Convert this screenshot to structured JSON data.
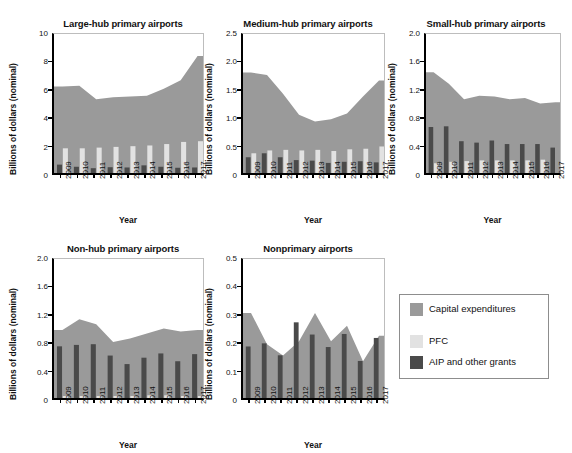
{
  "figure": {
    "yaxis_label": "Billions of dollars (nominal)",
    "xaxis_label": "Year",
    "footnote": ""
  },
  "legend": {
    "items": [
      {
        "label": "Capital expenditures",
        "color": "#9a9a9a",
        "name": "capital-expenditures"
      },
      {
        "label": "PFC",
        "color": "#e2e2e2",
        "name": "pfc"
      },
      {
        "label": "AIP and other grants",
        "color": "#4a4a4a",
        "name": "aip-and-other-grants"
      }
    ]
  },
  "chart_data": [
    {
      "id": "large-hub",
      "type": "area",
      "title": "Large-hub primary airports",
      "xlabel": "Year",
      "ylabel": "Billions of dollars (nominal)",
      "categories": [
        2009,
        2010,
        2011,
        2012,
        2013,
        2014,
        2015,
        2016,
        2017
      ],
      "tick_labels": [
        "2009",
        "2010",
        "2011",
        "2012",
        "2013",
        "2014",
        "2015",
        "2016",
        "2017"
      ],
      "ylim": [
        0,
        10
      ],
      "yticks": [
        0,
        2,
        4,
        6,
        8,
        10
      ],
      "ytick_labels": [
        "0",
        "2",
        "4",
        "6",
        "8",
        "10"
      ],
      "grid": false,
      "series": [
        {
          "name": "Capital expenditures",
          "kind": "area",
          "color": "#9a9a9a",
          "values": [
            6.3,
            6.35,
            5.4,
            5.55,
            5.6,
            5.65,
            6.15,
            6.75,
            8.45
          ]
        },
        {
          "name": "PFC",
          "kind": "bar",
          "color": "#e2e2e2",
          "values": [
            1.95,
            1.95,
            2.0,
            2.05,
            2.1,
            2.15,
            2.25,
            2.4,
            2.45
          ]
        },
        {
          "name": "AIP and other grants",
          "kind": "bar",
          "color": "#4a4a4a",
          "values": [
            0.8,
            0.65,
            0.55,
            0.62,
            0.6,
            0.75,
            0.65,
            0.58,
            0.6
          ]
        }
      ]
    },
    {
      "id": "medium-hub",
      "type": "area",
      "title": "Medium-hub primary airports",
      "xlabel": "Year",
      "ylabel": "Billions of dollars (nominal)",
      "categories": [
        2009,
        2010,
        2011,
        2012,
        2013,
        2014,
        2015,
        2016,
        2017
      ],
      "tick_labels": [
        "2009",
        "2010",
        "2011",
        "2012",
        "2013",
        "2014",
        "2015",
        "2016",
        "2017"
      ],
      "ylim": [
        0,
        2.5
      ],
      "yticks": [
        0,
        0.5,
        1.0,
        1.5,
        2.0,
        2.5
      ],
      "ytick_labels": [
        "0",
        "0.5",
        "1.0",
        "1.5",
        "2.0",
        "2.5"
      ],
      "grid": false,
      "series": [
        {
          "name": "Capital expenditures",
          "kind": "area",
          "color": "#9a9a9a",
          "values": [
            1.82,
            1.78,
            1.45,
            1.08,
            0.96,
            1.0,
            1.1,
            1.4,
            1.68
          ]
        },
        {
          "name": "PFC",
          "kind": "bar",
          "color": "#e2e2e2",
          "values": [
            0.4,
            0.45,
            0.46,
            0.45,
            0.46,
            0.44,
            0.47,
            0.48,
            0.52
          ]
        },
        {
          "name": "AIP and other grants",
          "kind": "bar",
          "color": "#4a4a4a",
          "values": [
            0.33,
            0.4,
            0.33,
            0.28,
            0.27,
            0.23,
            0.25,
            0.26,
            0.24
          ]
        }
      ]
    },
    {
      "id": "small-hub",
      "type": "area",
      "title": "Small-hub primary airports",
      "xlabel": "Year",
      "ylabel": "Billions of dollars (nominal)",
      "categories": [
        2009,
        2010,
        2011,
        2012,
        2013,
        2014,
        2015,
        2016,
        2017
      ],
      "tick_labels": [
        "2009",
        "2010",
        "2011",
        "2012",
        "2013",
        "2014",
        "2015",
        "2016",
        "2017"
      ],
      "ylim": [
        0,
        2.0
      ],
      "yticks": [
        0,
        0.4,
        0.8,
        1.2,
        1.6,
        2.0
      ],
      "ytick_labels": [
        "0",
        "0.4",
        "0.8",
        "1.2",
        "1.6",
        "2.0"
      ],
      "grid": false,
      "series": [
        {
          "name": "Capital expenditures",
          "kind": "area",
          "color": "#9a9a9a",
          "values": [
            1.46,
            1.3,
            1.08,
            1.13,
            1.12,
            1.08,
            1.1,
            1.02,
            1.04
          ]
        },
        {
          "name": "PFC",
          "kind": "bar",
          "color": "#e2e2e2",
          "values": [
            0.18,
            0.2,
            0.21,
            0.22,
            0.22,
            0.22,
            0.22,
            0.23,
            0.0
          ]
        },
        {
          "name": "AIP and other grants",
          "kind": "bar",
          "color": "#4a4a4a",
          "values": [
            0.69,
            0.7,
            0.49,
            0.47,
            0.5,
            0.45,
            0.45,
            0.45,
            0.4
          ]
        }
      ]
    },
    {
      "id": "non-hub",
      "type": "area",
      "title": "Non-hub primary airports",
      "xlabel": "Year",
      "ylabel": "Billions of dollars (nominal)",
      "categories": [
        2009,
        2010,
        2011,
        2012,
        2013,
        2014,
        2015,
        2016,
        2017
      ],
      "tick_labels": [
        "2009",
        "2010",
        "2011",
        "2012",
        "2013",
        "2014",
        "2015",
        "2016",
        "2017"
      ],
      "ylim": [
        0,
        2.0
      ],
      "yticks": [
        0,
        0.4,
        0.8,
        1.2,
        1.6,
        2.0
      ],
      "ytick_labels": [
        "0",
        "0.4",
        "0.8",
        "1.2",
        "1.6",
        "2.0"
      ],
      "grid": false,
      "series": [
        {
          "name": "Capital expenditures",
          "kind": "area",
          "color": "#9a9a9a",
          "values": [
            1.0,
            1.15,
            1.08,
            0.83,
            0.88,
            0.95,
            1.02,
            0.98,
            1.0
          ]
        },
        {
          "name": "PFC",
          "kind": "bar",
          "color": "#e2e2e2",
          "values": [
            0.07,
            0.07,
            0.07,
            0.07,
            0.07,
            0.08,
            0.08,
            0.07,
            0.07
          ]
        },
        {
          "name": "AIP and other grants",
          "kind": "bar",
          "color": "#4a4a4a",
          "values": [
            0.77,
            0.79,
            0.8,
            0.64,
            0.52,
            0.61,
            0.67,
            0.56,
            0.66
          ]
        }
      ]
    },
    {
      "id": "nonprimary",
      "type": "area",
      "title": "Nonprimary airports",
      "xlabel": "Year",
      "ylabel": "Billions of dollars (nominal)",
      "categories": [
        2009,
        2010,
        2011,
        2012,
        2013,
        2014,
        2015,
        2016,
        2017
      ],
      "tick_labels": [
        "2009",
        "2010",
        "2011",
        "2012",
        "2013",
        "2014",
        "2015",
        "2016",
        "2017"
      ],
      "ylim": [
        0,
        0.5
      ],
      "yticks": [
        0,
        0.1,
        0.2,
        0.3,
        0.4,
        0.5
      ],
      "ytick_labels": [
        "0",
        "0.1",
        "0.2",
        "0.3",
        "0.4",
        "0.5"
      ],
      "grid": false,
      "series": [
        {
          "name": "Capital expenditures",
          "kind": "area",
          "color": "#9a9a9a",
          "values": [
            0.31,
            0.2,
            0.16,
            0.21,
            0.31,
            0.21,
            0.265,
            0.14,
            0.23
          ]
        },
        {
          "name": "PFC",
          "kind": "bar",
          "color": "#e2e2e2",
          "values": [
            0.0,
            0.0,
            0.0,
            0.0,
            0.0,
            0.0,
            0.0,
            0.0,
            0.0
          ]
        },
        {
          "name": "AIP and other grants",
          "kind": "bar",
          "color": "#4a4a4a",
          "values": [
            0.192,
            0.203,
            0.161,
            0.277,
            0.234,
            0.19,
            0.236,
            0.141,
            0.222
          ]
        }
      ]
    }
  ],
  "panels": [
    {
      "id": "large-hub",
      "left": 22,
      "top": 18,
      "plotLeft": 52,
      "plotTop": 33,
      "plotW": 152,
      "plotH": 142,
      "titleLeft": 28,
      "titleW": 190
    },
    {
      "id": "medium-hub",
      "left": 205,
      "top": 18,
      "plotLeft": 241,
      "plotTop": 33,
      "plotW": 144,
      "plotH": 142,
      "titleLeft": 213,
      "titleW": 190
    },
    {
      "id": "small-hub",
      "left": 388,
      "top": 18,
      "plotLeft": 424,
      "plotTop": 33,
      "plotW": 137,
      "plotH": 142,
      "titleLeft": 396,
      "titleW": 180
    },
    {
      "id": "non-hub",
      "left": 22,
      "top": 243,
      "plotLeft": 52,
      "plotTop": 258,
      "plotW": 152,
      "plotH": 142,
      "titleLeft": 28,
      "titleW": 190
    },
    {
      "id": "nonprimary",
      "left": 205,
      "top": 243,
      "plotLeft": 241,
      "plotTop": 258,
      "plotW": 144,
      "plotH": 142,
      "titleLeft": 213,
      "titleW": 190
    }
  ]
}
